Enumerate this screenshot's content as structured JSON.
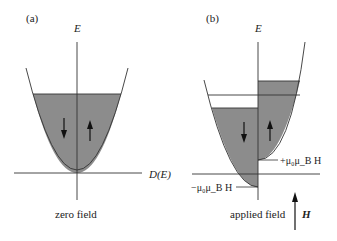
{
  "panel_a": {
    "label": "(a)",
    "axis_label": "E",
    "caption": "zero field",
    "arrows": [
      "down",
      "up"
    ]
  },
  "panel_b": {
    "label": "(b)",
    "axis_label": "E",
    "caption": "applied field",
    "field_symbol": "H",
    "plus_label": "+μ₀μ_B H",
    "minus_label": "−μ₀μ_B H",
    "arrows": [
      "down",
      "up"
    ]
  },
  "dos_label": "D(E)",
  "colors": {
    "fill": "#8c8c8c",
    "line": "#333333"
  }
}
